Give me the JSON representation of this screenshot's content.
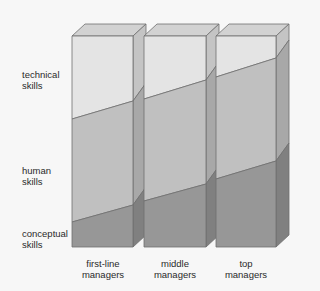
{
  "row_labels": {
    "technical": [
      "technical",
      "skills"
    ],
    "human": [
      "human",
      "skills"
    ],
    "conceptual": [
      "conceptual",
      "skills"
    ]
  },
  "columns": [
    {
      "label_line1": "first-line",
      "label_line2": "managers"
    },
    {
      "label_line1": "middle",
      "label_line2": "managers"
    },
    {
      "label_line1": "top",
      "label_line2": "managers"
    }
  ],
  "colors": {
    "technical_front": "#e4e4e4",
    "human_front": "#c0c0c0",
    "conceptual_front": "#979797",
    "top_face": "#d2d2d2",
    "technical_side": "#c4c4c4",
    "human_side": "#a8a8a8",
    "conceptual_side": "#808080",
    "edge": "#6e6e6e"
  },
  "chart_data": {
    "type": "stacked-bar-3d",
    "categories": [
      "first-line managers",
      "middle managers",
      "top managers"
    ],
    "series": [
      {
        "name": "conceptual skills",
        "values_left_pct": [
          12,
          22,
          32
        ],
        "values_right_pct": [
          20,
          30,
          41
        ]
      },
      {
        "name": "human skills",
        "values_left_pct": [
          61,
          52,
          48
        ],
        "values_right_pct": [
          51,
          49,
          45
        ]
      },
      {
        "name": "technical skills",
        "values_left_pct": [
          27,
          26,
          20
        ],
        "values_right_pct": [
          29,
          21,
          14
        ]
      }
    ],
    "geometry": {
      "front_top_y": 36,
      "front_bottom_y": 247,
      "depth_dx": 13,
      "depth_dy": -12,
      "boxes": [
        {
          "x0": 72,
          "x1": 133,
          "tech_human": [
            119,
            101
          ],
          "human_concept": [
            222,
            205
          ]
        },
        {
          "x0": 144,
          "x1": 206,
          "tech_human": [
            99,
            80
          ],
          "human_concept": [
            201,
            184
          ]
        },
        {
          "x0": 216,
          "x1": 276,
          "tech_human": [
            77,
            58
          ],
          "human_concept": [
            179,
            161
          ]
        }
      ]
    },
    "xlabel": "",
    "ylabel": ""
  }
}
